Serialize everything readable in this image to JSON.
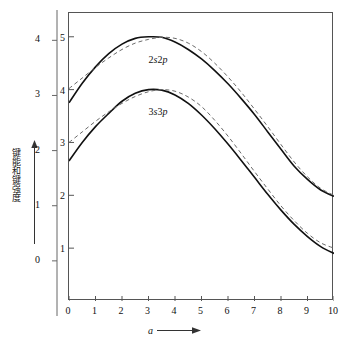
{
  "chart_data": {
    "type": "line",
    "title": "",
    "xlabel": "a",
    "ylabel": "键能和键强度",
    "xlim": [
      0,
      10
    ],
    "x_ticks": [
      "0",
      "1",
      "2",
      "3",
      "4",
      "5",
      "6",
      "7",
      "8",
      "9",
      "10"
    ],
    "left_outer_axis": {
      "label": "",
      "ticks": [
        "0",
        "1",
        "2",
        "3",
        "4"
      ],
      "lim": [
        -1,
        4.55
      ]
    },
    "left_inner_axis": {
      "label": "",
      "ticks": [
        "1",
        "2",
        "3",
        "4",
        "5"
      ],
      "lim": [
        0,
        5.45
      ]
    },
    "grid": false,
    "legend": "inline-annotations",
    "annotations": [
      {
        "text": "2s2p",
        "x": 3.0,
        "y": 4.55
      },
      {
        "text": "3s3p",
        "x": 3.0,
        "y": 3.55
      }
    ],
    "series": [
      {
        "name": "2s2p solid",
        "style": "solid",
        "x": [
          0,
          0.5,
          1,
          1.5,
          2,
          2.5,
          3,
          3.5,
          4,
          4.5,
          5,
          5.5,
          6,
          6.5,
          7,
          7.5,
          8,
          8.5,
          9,
          9.5,
          10
        ],
        "y": [
          3.75,
          4.12,
          4.43,
          4.68,
          4.86,
          4.97,
          5.0,
          4.99,
          4.9,
          4.76,
          4.58,
          4.36,
          4.11,
          3.83,
          3.53,
          3.2,
          2.87,
          2.55,
          2.3,
          2.1,
          1.98
        ]
      },
      {
        "name": "2s2p dashed",
        "style": "dashed",
        "x": [
          0,
          0.5,
          1,
          1.5,
          2,
          2.5,
          3,
          3.5,
          4,
          4.5,
          5,
          5.5,
          6,
          6.5,
          7,
          7.5,
          8,
          8.5,
          9,
          9.5,
          10
        ],
        "y": [
          4.02,
          4.22,
          4.42,
          4.6,
          4.76,
          4.88,
          4.95,
          4.99,
          4.97,
          4.88,
          4.72,
          4.5,
          4.24,
          3.95,
          3.63,
          3.3,
          2.96,
          2.63,
          2.35,
          2.13,
          2.0
        ]
      },
      {
        "name": "3s3p solid",
        "style": "solid",
        "x": [
          0,
          0.5,
          1,
          1.5,
          2,
          2.5,
          3,
          3.5,
          4,
          4.5,
          5,
          5.5,
          6,
          6.5,
          7,
          7.5,
          8,
          8.5,
          9,
          9.5,
          10
        ],
        "y": [
          2.65,
          3.0,
          3.3,
          3.55,
          3.78,
          3.93,
          4.0,
          3.99,
          3.9,
          3.74,
          3.52,
          3.26,
          2.97,
          2.66,
          2.34,
          2.02,
          1.72,
          1.45,
          1.22,
          1.03,
          0.9
        ]
      },
      {
        "name": "3s3p dashed",
        "style": "dashed",
        "x": [
          0,
          0.5,
          1,
          1.5,
          2,
          2.5,
          3,
          3.5,
          4,
          4.5,
          5,
          5.5,
          6,
          6.5,
          7,
          7.5,
          8,
          8.5,
          9,
          9.5,
          10
        ],
        "y": [
          3.0,
          3.2,
          3.4,
          3.58,
          3.74,
          3.87,
          3.96,
          4.0,
          3.97,
          3.86,
          3.68,
          3.42,
          3.12,
          2.79,
          2.45,
          2.12,
          1.8,
          1.52,
          1.28,
          1.1,
          1.0
        ]
      }
    ]
  },
  "axes": {
    "x_caption": "a",
    "y_caption": "键能和键强度"
  },
  "icons": {
    "x_arrow": "arrow-right-icon",
    "y_arrow": "arrow-up-icon"
  }
}
